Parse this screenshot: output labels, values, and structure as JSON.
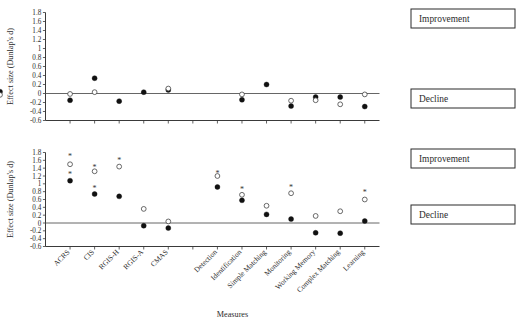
{
  "figure": {
    "xlabel": "Measures",
    "ylabel": "Effect size (Dunlap's d)",
    "annotation_improvement": "Improvement",
    "annotation_decline": "Decline"
  },
  "chart_data": [
    {
      "type": "scatter",
      "panel": "top",
      "title": "",
      "xlabel": "",
      "ylabel": "Effect size (Dunlap's d)",
      "ylim": [
        -0.6,
        1.8
      ],
      "yticks": [
        "1.8",
        "1.6",
        "1.4",
        "1.2",
        "1",
        "0.8",
        "0.6",
        "0.4",
        "0.2",
        "0",
        "-0.2",
        "-0.4",
        "-0.6"
      ],
      "ytick_values": [
        1.8,
        1.6,
        1.4,
        1.2,
        1.0,
        0.8,
        0.6,
        0.4,
        0.2,
        0,
        -0.2,
        -0.4,
        -0.6
      ],
      "grid": false,
      "legend": "none",
      "zero_reference_line": 0,
      "categories": [
        "ACRS",
        "CIS",
        "RGIS-H",
        "RGIS-A",
        "CMAS",
        "Detection",
        "Identification",
        "Simple Matching",
        "Monitoring",
        "Working Memory",
        "Complex Matching",
        "Learning"
      ],
      "series": [
        {
          "name": "filled-circle",
          "marker": "filled-circle",
          "values": [
            -0.15,
            0.34,
            -0.17,
            0.03,
            0.08,
            null,
            -0.14,
            0.2,
            -0.28,
            -0.08,
            -0.08,
            -0.29,
            0.04
          ]
        },
        {
          "name": "open-circle",
          "marker": "open-circle",
          "values": [
            -0.01,
            0.03,
            null,
            null,
            0.11,
            null,
            -0.02,
            null,
            -0.16,
            -0.15,
            -0.24,
            -0.02,
            -0.03
          ]
        },
        {
          "name": "asterisk",
          "marker": "asterisk",
          "values": []
        }
      ]
    },
    {
      "type": "scatter",
      "panel": "bottom",
      "title": "",
      "xlabel": "Measures",
      "ylabel": "Effect size (Dunlap's d)",
      "ylim": [
        -0.6,
        1.8
      ],
      "yticks": [
        "1.8",
        "1.6",
        "1.4",
        "1.2",
        "1",
        "0.8",
        "0.6",
        "0.4",
        "0.2",
        "0",
        "-0.2",
        "-0.4",
        "-0.6"
      ],
      "ytick_values": [
        1.8,
        1.6,
        1.4,
        1.2,
        1.0,
        0.8,
        0.6,
        0.4,
        0.2,
        0,
        -0.2,
        -0.4,
        -0.6
      ],
      "grid": false,
      "legend": "none",
      "zero_reference_line": 0,
      "categories": [
        "ACRS",
        "CIS",
        "RGIS-H",
        "RGIS-A",
        "CMAS",
        "Detection",
        "Identification",
        "Simple Matching",
        "Monitoring",
        "Working Memory",
        "Complex Matching",
        "Learning"
      ],
      "series": [
        {
          "name": "filled-circle",
          "marker": "filled-circle",
          "values": [
            1.08,
            0.74,
            0.68,
            -0.07,
            -0.13,
            0.92,
            0.58,
            0.22,
            0.1,
            -0.25,
            -0.26,
            0.05
          ]
        },
        {
          "name": "open-circle",
          "marker": "open-circle",
          "values": [
            1.5,
            1.32,
            1.44,
            0.36,
            0.04,
            1.2,
            0.72,
            0.44,
            0.76,
            0.18,
            0.3,
            0.6
          ]
        },
        {
          "name": "asterisk",
          "marker": "asterisk",
          "values": [
            1.72,
            1.44,
            1.6,
            null,
            null,
            1.28,
            0.86,
            null,
            0.92,
            null,
            null,
            0.78
          ]
        },
        {
          "name": "asterisk-secondary",
          "marker": "asterisk",
          "values": [
            1.24,
            0.9,
            null,
            null,
            null,
            null,
            null,
            null,
            null,
            null,
            null,
            null
          ]
        }
      ]
    }
  ],
  "xaxis": {
    "labels": [
      "ACRS",
      "CIS",
      "RGIS-H",
      "RGIS-A",
      "CMAS",
      "Detection",
      "Identification",
      "Simple Matching",
      "Monitoring",
      "Working Memory",
      "Complex Matching",
      "Learning"
    ]
  },
  "yaxis": {
    "labels": [
      "1.8",
      "1.6",
      "1.4",
      "1.2",
      "1",
      "0.8",
      "0.6",
      "0.4",
      "0.2",
      "0",
      "-0.2",
      "-0.4",
      "-0.6"
    ]
  }
}
